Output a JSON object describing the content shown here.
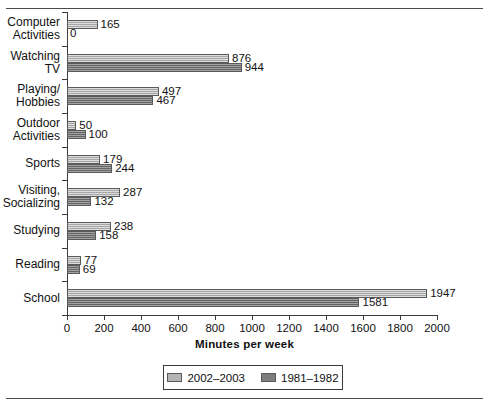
{
  "chart_data": {
    "type": "bar",
    "orientation": "horizontal",
    "title": "",
    "xlabel": "Minutes per week",
    "ylabel": "",
    "xlim": [
      0,
      2000
    ],
    "xticks": [
      0,
      200,
      400,
      600,
      800,
      1000,
      1200,
      1400,
      1600,
      1800,
      2000
    ],
    "xtick_labels": [
      "0",
      "200",
      "400",
      "600",
      "800",
      "1000",
      "1200",
      "1400",
      "1600",
      "1800",
      "2000"
    ],
    "grid": false,
    "legend_position": "bottom-center",
    "categories": [
      "Computer\nActivities",
      "Watching\nTV",
      "Playing/\nHobbies",
      "Outdoor\nActivities",
      "Sports",
      "Visiting,\nSocializing",
      "Studying",
      "Reading",
      "School"
    ],
    "series": [
      {
        "name": "2002–2003",
        "color": "#b4b4b4",
        "values": [
          165,
          876,
          497,
          50,
          179,
          287,
          238,
          77,
          1947
        ],
        "labels": [
          "165",
          "876",
          "497",
          "50",
          "179",
          "287",
          "238",
          "77",
          "1947"
        ]
      },
      {
        "name": "1981–1982",
        "color": "#7e7e7e",
        "values": [
          0,
          944,
          467,
          100,
          244,
          132,
          158,
          69,
          1581
        ],
        "labels": [
          "0",
          "944",
          "467",
          "100",
          "244",
          "132",
          "158",
          "69",
          "1581"
        ]
      }
    ]
  },
  "legend": {
    "items": [
      {
        "label": "2002–2003",
        "color": "#b4b4b4"
      },
      {
        "label": "1981–1982",
        "color": "#7e7e7e"
      }
    ]
  }
}
